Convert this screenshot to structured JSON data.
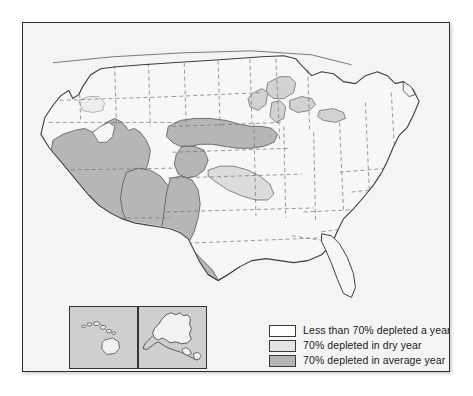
{
  "figure": {
    "kind": "thematic-map",
    "region": "United States"
  },
  "map": {
    "background_color": "#f4f4f4",
    "border_color": "#2b2b2b",
    "state_line_color": "#6f6f6f",
    "coast_line_color": "#4a4a4a",
    "lake_color": "#d2d2d2"
  },
  "legend": {
    "items": [
      {
        "label": "Less than 70% depleted a year",
        "color": "#ffffff",
        "swatch_name": "legend-swatch-white"
      },
      {
        "label": "70% depleted in dry year",
        "color": "#e3e3e3",
        "swatch_name": "legend-swatch-light-gray"
      },
      {
        "label": "70% depleted in average year",
        "color": "#b4b4b4",
        "swatch_name": "legend-swatch-medium-gray"
      }
    ]
  },
  "insets": [
    {
      "name": "hawaii-inset",
      "title": "Hawaii",
      "background": "#cfcfcf",
      "land": "#f2f2f2"
    },
    {
      "name": "alaska-inset",
      "title": "Alaska",
      "background": "#cfcfcf",
      "land": "#f2f2f2"
    }
  ],
  "shaded_regions": [
    {
      "name": "california-nevada-arizona",
      "class": "average-year"
    },
    {
      "name": "ogallala-high-plains",
      "class": "average-year"
    },
    {
      "name": "texas-rio-grande",
      "class": "average-year"
    },
    {
      "name": "central-kansas-oklahoma",
      "class": "dry-year"
    },
    {
      "name": "mississippi-embayment",
      "class": "dry-year"
    }
  ]
}
